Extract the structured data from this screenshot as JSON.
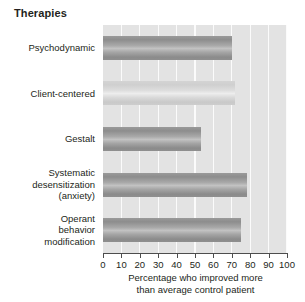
{
  "chart_data": {
    "type": "bar",
    "orientation": "horizontal",
    "title": "Therapies",
    "xlabel_line1": "Percentage who improved more",
    "xlabel_line2": "than average control patient",
    "ylabel": "",
    "xlim": [
      0,
      100
    ],
    "grid": true,
    "legend": "none",
    "categories": [
      "Psychodynamic",
      "Client-centered",
      "Gestalt",
      "Systematic desensitization (anxiety)",
      "Operant behavior modification"
    ],
    "category_lines": [
      [
        "Psychodynamic"
      ],
      [
        "Client-centered"
      ],
      [
        "Gestalt"
      ],
      [
        "Systematic",
        "desensitization",
        "(anxiety)"
      ],
      [
        "Operant",
        "behavior",
        "modification"
      ]
    ],
    "values": [
      70,
      72,
      53,
      78,
      75
    ],
    "tick_labels": [
      "0",
      "10",
      "20",
      "30",
      "40",
      "50",
      "60",
      "70",
      "80",
      "90",
      "100"
    ],
    "tick_values": [
      0,
      10,
      20,
      30,
      40,
      50,
      60,
      70,
      80,
      90,
      100
    ],
    "bar_colors": [
      "#9a9a9a",
      "#d4d4d4",
      "#9a9a9a",
      "#9a9a9a",
      "#9a9a9a"
    ],
    "plot_background": "#e3e3e3",
    "gridline_color": "#fbfbfb",
    "axis_color": "#4d4d4d",
    "text_color": "#231f20"
  }
}
